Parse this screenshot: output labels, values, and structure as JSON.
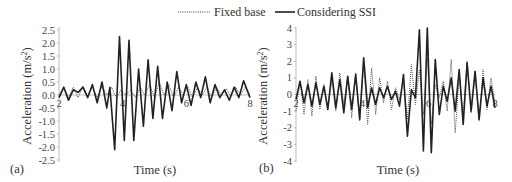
{
  "legend": {
    "items": [
      {
        "label": "Fixed base",
        "style": "dotted"
      },
      {
        "label": "Considering SSI",
        "style": "solid"
      }
    ]
  },
  "chart_data": [
    {
      "panel": "(a)",
      "type": "line",
      "xlabel": "Time (s)",
      "ylabel": "Acceleration (m/s²)",
      "xlim": [
        2,
        8
      ],
      "ylim": [
        -2.5,
        2.5
      ],
      "x_ticks": [
        "2",
        "4",
        "6",
        "8"
      ],
      "y_ticks": [
        "2.5",
        "2.0",
        "1.5",
        "1.0",
        "0.5",
        "0.0",
        "-0.5",
        "-1.0",
        "-1.5",
        "-2.0",
        "-2.5"
      ],
      "grid": false,
      "legend_position": "top-center",
      "series": [
        {
          "name": "Fixed base",
          "style": "dotted",
          "x": [
            2.0,
            2.15,
            2.3,
            2.45,
            2.6,
            2.75,
            2.9,
            3.05,
            3.2,
            3.35,
            3.5,
            3.65,
            3.8,
            3.95,
            4.1,
            4.25,
            4.4,
            4.55,
            4.7,
            4.85,
            5.0,
            5.15,
            5.3,
            5.45,
            5.6,
            5.75,
            5.9,
            6.05,
            6.2,
            6.35,
            6.5,
            6.65,
            6.8,
            6.95,
            7.1,
            7.25,
            7.4,
            7.55,
            7.7,
            7.85,
            8.0
          ],
          "values": [
            0.0,
            0.3,
            -0.1,
            0.3,
            -0.1,
            0.35,
            -0.05,
            0.3,
            -0.1,
            0.35,
            0.0,
            0.3,
            -0.1,
            0.2,
            0.0,
            0.2,
            -0.1,
            0.3,
            0.0,
            0.4,
            -0.1,
            0.5,
            0.0,
            0.4,
            -0.1,
            0.3,
            0.0,
            0.3,
            -0.1,
            0.3,
            0.0,
            0.3,
            -0.1,
            0.3,
            0.0,
            0.25,
            -0.05,
            0.3,
            0.0,
            0.3,
            0.0
          ]
        },
        {
          "name": "Considering SSI",
          "style": "solid",
          "x": [
            2.0,
            2.15,
            2.3,
            2.45,
            2.6,
            2.75,
            2.9,
            3.05,
            3.2,
            3.35,
            3.5,
            3.6,
            3.75,
            3.9,
            4.05,
            4.2,
            4.35,
            4.5,
            4.65,
            4.8,
            4.95,
            5.1,
            5.25,
            5.4,
            5.55,
            5.7,
            5.85,
            6.0,
            6.15,
            6.3,
            6.45,
            6.6,
            6.75,
            6.9,
            7.05,
            7.2,
            7.35,
            7.5,
            7.65,
            7.8,
            8.0
          ],
          "values": [
            -0.1,
            0.3,
            -0.2,
            0.2,
            0.1,
            0.3,
            -0.1,
            0.4,
            -0.3,
            0.5,
            -0.5,
            0.3,
            -2.1,
            2.25,
            -1.75,
            2.1,
            -1.75,
            1.0,
            -1.2,
            1.35,
            -0.9,
            1.1,
            -0.9,
            0.5,
            -0.6,
            0.9,
            -0.3,
            0.4,
            -0.4,
            0.5,
            -0.1,
            0.7,
            -0.3,
            0.4,
            -0.1,
            0.2,
            -0.2,
            0.3,
            -0.1,
            0.55,
            -0.1
          ]
        }
      ]
    },
    {
      "panel": "(b)",
      "type": "line",
      "xlabel": "Time (s)",
      "ylabel": "Acceleration (m/s²)",
      "xlim": [
        2,
        8
      ],
      "ylim": [
        -4,
        4
      ],
      "x_ticks": [
        "2",
        "4",
        "6",
        "8"
      ],
      "y_ticks": [
        "4",
        "3",
        "2",
        "1",
        "0",
        "-1",
        "-2",
        "-3",
        "-4"
      ],
      "grid": false,
      "series": [
        {
          "name": "Fixed base",
          "style": "dotted",
          "x": [
            2.0,
            2.12,
            2.24,
            2.36,
            2.48,
            2.6,
            2.72,
            2.84,
            2.96,
            3.08,
            3.2,
            3.32,
            3.44,
            3.56,
            3.68,
            3.8,
            3.92,
            4.04,
            4.16,
            4.28,
            4.4,
            4.52,
            4.64,
            4.76,
            4.88,
            5.0,
            5.12,
            5.24,
            5.36,
            5.48,
            5.6,
            5.72,
            5.84,
            5.96,
            6.08,
            6.2,
            6.32,
            6.44,
            6.56,
            6.68,
            6.8,
            6.92,
            7.04,
            7.16,
            7.28,
            7.4,
            7.52,
            7.64,
            7.76,
            7.88,
            8.0
          ],
          "values": [
            -1.0,
            0.8,
            -1.2,
            0.9,
            -1.3,
            1.1,
            -0.9,
            0.6,
            -0.8,
            0.9,
            -1.0,
            1.3,
            -0.6,
            1.0,
            -1.4,
            1.3,
            -1.6,
            2.0,
            -1.8,
            1.6,
            -1.2,
            1.0,
            -0.5,
            0.8,
            -0.9,
            0.4,
            -0.3,
            0.9,
            -1.5,
            1.8,
            -0.6,
            1.5,
            -1.2,
            2.2,
            -1.8,
            0.6,
            -0.2,
            0.8,
            -1.0,
            2.1,
            -2.3,
            1.1,
            -1.2,
            2.0,
            -1.1,
            1.3,
            -1.6,
            1.5,
            -0.9,
            1.0,
            -0.5
          ]
        },
        {
          "name": "Considering SSI",
          "style": "solid",
          "x": [
            2.0,
            2.12,
            2.24,
            2.36,
            2.48,
            2.6,
            2.72,
            2.84,
            2.96,
            3.08,
            3.2,
            3.32,
            3.44,
            3.56,
            3.68,
            3.8,
            3.92,
            4.04,
            4.16,
            4.28,
            4.4,
            4.52,
            4.64,
            4.76,
            4.88,
            5.0,
            5.12,
            5.24,
            5.36,
            5.48,
            5.6,
            5.72,
            5.84,
            5.96,
            6.08,
            6.2,
            6.32,
            6.44,
            6.56,
            6.68,
            6.8,
            6.92,
            7.04,
            7.16,
            7.28,
            7.4,
            7.52,
            7.64,
            7.76,
            7.88,
            8.0
          ],
          "values": [
            -0.3,
            0.8,
            -0.5,
            0.6,
            -0.7,
            0.7,
            -0.6,
            0.5,
            -0.9,
            1.3,
            -0.8,
            0.9,
            -1.1,
            1.1,
            -0.9,
            1.2,
            -1.5,
            2.2,
            -0.8,
            0.4,
            -0.6,
            0.4,
            -0.2,
            0.5,
            -0.3,
            0.2,
            -0.7,
            1.2,
            -2.5,
            0.3,
            -0.2,
            3.9,
            -3.4,
            4.0,
            -3.5,
            2.1,
            -1.2,
            0.5,
            -0.4,
            1.0,
            -1.0,
            1.5,
            -1.8,
            1.9,
            -1.0,
            1.4,
            -1.5,
            1.0,
            -0.7,
            0.5,
            -0.8
          ]
        }
      ]
    }
  ]
}
